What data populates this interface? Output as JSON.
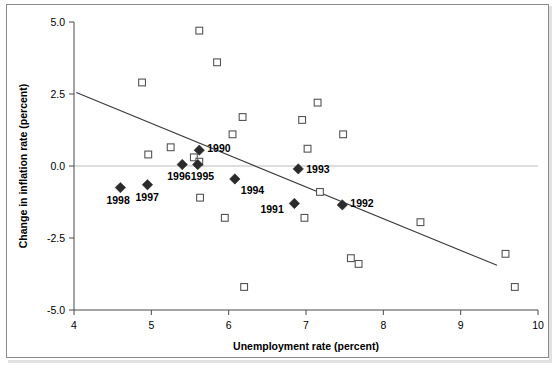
{
  "chart_data": {
    "type": "scatter",
    "title": "",
    "xlabel": "Unemployment rate (percent)",
    "ylabel": "Change in inflation rate (percent)",
    "xlim": [
      4,
      10
    ],
    "ylim": [
      -5.0,
      5.0
    ],
    "xticks": [
      "4",
      "5",
      "6",
      "7",
      "8",
      "9",
      "10"
    ],
    "xtick_values": [
      4,
      5,
      6,
      7,
      8,
      9,
      10
    ],
    "yticks": [
      "5.0",
      "2.5",
      "0.0",
      "-2.5",
      "-5.0"
    ],
    "ytick_values": [
      5.0,
      2.5,
      0.0,
      -2.5,
      -5.0
    ],
    "grid": false,
    "zero_line": true,
    "legend": "none",
    "series": [
      {
        "name": "Other years",
        "marker": "open-square",
        "marker_color": "#ffffff",
        "marker_edge_color": "#555555",
        "points": [
          {
            "x": 4.88,
            "y": 2.9
          },
          {
            "x": 4.96,
            "y": 0.4
          },
          {
            "x": 5.25,
            "y": 0.65
          },
          {
            "x": 5.55,
            "y": 0.3
          },
          {
            "x": 5.62,
            "y": 4.7
          },
          {
            "x": 5.62,
            "y": 0.15
          },
          {
            "x": 5.63,
            "y": -1.1
          },
          {
            "x": 5.85,
            "y": 3.6
          },
          {
            "x": 5.95,
            "y": -1.8
          },
          {
            "x": 6.05,
            "y": 1.1
          },
          {
            "x": 6.18,
            "y": 1.7
          },
          {
            "x": 6.2,
            "y": -4.2
          },
          {
            "x": 6.95,
            "y": 1.6
          },
          {
            "x": 6.98,
            "y": -1.8
          },
          {
            "x": 7.02,
            "y": 0.6
          },
          {
            "x": 7.15,
            "y": 2.2
          },
          {
            "x": 7.18,
            "y": -0.9
          },
          {
            "x": 7.48,
            "y": 1.1
          },
          {
            "x": 7.58,
            "y": -3.2
          },
          {
            "x": 7.68,
            "y": -3.4
          },
          {
            "x": 8.48,
            "y": -1.95
          },
          {
            "x": 9.58,
            "y": -3.05
          },
          {
            "x": 9.7,
            "y": -4.2
          }
        ]
      },
      {
        "name": "Labeled years",
        "marker": "filled-diamond",
        "marker_color": "#2b2b2b",
        "points": [
          {
            "x": 4.6,
            "y": -0.75,
            "label": "1998",
            "label_dx": -14,
            "label_dy": 16
          },
          {
            "x": 4.95,
            "y": -0.65,
            "label": "1997",
            "label_dx": -12,
            "label_dy": 16
          },
          {
            "x": 5.4,
            "y": 0.05,
            "label": "1996",
            "label_dx": -15,
            "label_dy": 15
          },
          {
            "x": 5.6,
            "y": 0.05,
            "label": "1995",
            "label_dx": -7,
            "label_dy": 15
          },
          {
            "x": 5.62,
            "y": 0.55,
            "label": "1990",
            "label_dx": 8,
            "label_dy": 2
          },
          {
            "x": 6.08,
            "y": -0.45,
            "label": "1994",
            "label_dx": 6,
            "label_dy": 15
          },
          {
            "x": 6.85,
            "y": -1.3,
            "label": "1991",
            "label_dx": -34,
            "label_dy": 10
          },
          {
            "x": 6.9,
            "y": -0.1,
            "label": "1993",
            "label_dx": 8,
            "label_dy": 4
          },
          {
            "x": 7.47,
            "y": -1.35,
            "label": "1992",
            "label_dx": 8,
            "label_dy": 2
          }
        ]
      }
    ],
    "trendline": {
      "name": "fitted-regression-line",
      "x1": 4.03,
      "y1": 2.55,
      "x2": 9.47,
      "y2": -3.45,
      "color": "#3a3a3a"
    }
  },
  "colors": {
    "frame": "#8a8a8a",
    "axis": "#4a4a4a",
    "zero_line": "#bdbdbd",
    "marker_open_edge": "#555555",
    "marker_filled": "#2b2b2b",
    "trendline": "#3a3a3a",
    "text": "#000000"
  }
}
